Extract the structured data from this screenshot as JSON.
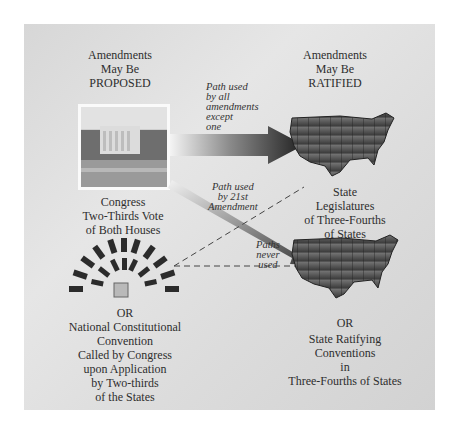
{
  "proposed_header": [
    "Amendments",
    "May Be",
    "PROPOSED"
  ],
  "ratified_header": [
    "Amendments",
    "May Be",
    "RATIFIED"
  ],
  "congress_caption": [
    "Congress",
    "Two-Thirds Vote",
    "of Both Houses"
  ],
  "convention_caption": [
    "OR",
    "National Constitutional",
    "Convention",
    "Called by Congress",
    "upon  Application",
    "by Two-thirds",
    "of the States"
  ],
  "legislatures_caption": [
    "State",
    "Legislatures",
    "of Three-Fourths",
    "of States"
  ],
  "conventions_caption": [
    "OR",
    "State Ratifying",
    "Conventions",
    "in",
    "Three-Fourths of States"
  ],
  "path_labels": {
    "main": [
      "Path used",
      "by all",
      "amendments",
      "except",
      "one"
    ],
    "twentyfirst": [
      "Path used",
      "by 21st",
      "Amendment"
    ],
    "never": [
      "Paths",
      "never",
      "used"
    ]
  },
  "icons": {
    "congress": "white-house-photo",
    "convention": "convention-seating",
    "states": "us-map"
  },
  "colors": {
    "panel": "#dcdcdc",
    "arrow_dark": "#2a2a2a",
    "text": "#2e2e2e"
  }
}
